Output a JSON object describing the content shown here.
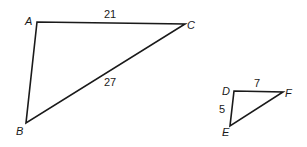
{
  "triangles": [
    {
      "name": "ABC",
      "vertices": {
        "A": "A",
        "B": "B",
        "C": "C"
      },
      "sides": {
        "AC": "21",
        "BC": "27"
      }
    },
    {
      "name": "DEF",
      "vertices": {
        "D": "D",
        "E": "E",
        "F": "F"
      },
      "sides": {
        "DF": "7",
        "DE": "5"
      }
    }
  ]
}
